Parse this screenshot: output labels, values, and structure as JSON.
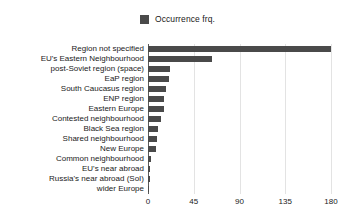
{
  "legend": {
    "items": [
      {
        "label": "Occurrence frq.",
        "color": "#4a4a4a",
        "swatch_icon": "square-swatch-icon"
      }
    ],
    "position": "top-center"
  },
  "axis": {
    "x_ticks": [
      "0",
      "45",
      "90",
      "135",
      "180"
    ]
  },
  "chart_data": {
    "type": "bar",
    "orientation": "horizontal",
    "title": "",
    "subtitle": "",
    "xlabel": "",
    "ylabel": "",
    "xlim": [
      0,
      180
    ],
    "xticks": [
      0,
      45,
      90,
      135,
      180
    ],
    "grid": true,
    "legend_position": "top-center",
    "series": [
      {
        "name": "Occurrence frq.",
        "color": "#4a4a4a",
        "values": [
          180,
          63,
          22,
          21,
          18,
          16,
          16,
          13,
          10,
          9,
          8,
          3,
          2,
          2,
          1
        ]
      }
    ],
    "categories": [
      "Region not specified",
      "EU's Eastern Neighbourhood",
      "post-Soviet region (space)",
      "EaP region",
      "South Caucasus region",
      "ENP region",
      "Eastern Europe",
      "Contested neighbourhood",
      "Black Sea region",
      "Shared neighbourhood",
      "New Europe",
      "Common neighbourhood",
      "EU's near abroad",
      "Russia's near abroad (SoI)",
      "wider Europe"
    ]
  },
  "colors": {
    "bar": "#4a4a4a",
    "grid": "#e3e3e3",
    "axis": "#5a5a5a",
    "background": "#ffffff",
    "text": "#1a1a1a"
  }
}
